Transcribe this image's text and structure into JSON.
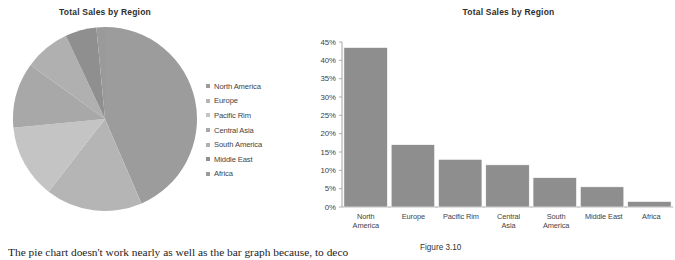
{
  "pie": {
    "title": "Total Sales by Region",
    "legend": [
      {
        "label": "North America",
        "color": "#9c9c9c"
      },
      {
        "label": "Europe",
        "color": "#b5b5b5"
      },
      {
        "label": "Pacific Rim",
        "color": "#c4c4c4"
      },
      {
        "label": "Central Asia",
        "color": "#a8a8a8"
      },
      {
        "label": "South America",
        "color": "#b0b0b0"
      },
      {
        "label": "Middle East",
        "color": "#8f8f8f"
      },
      {
        "label": "Africa",
        "color": "#9a9a9a"
      }
    ]
  },
  "bar": {
    "title": "Total Sales by Region"
  },
  "caption": {
    "figure_label": "Figure 3.10"
  },
  "body": {
    "paragraph": "The pie chart doesn't work nearly as well as the bar graph because, to decode it"
  },
  "chart_data": [
    {
      "type": "pie",
      "title": "Total Sales by Region",
      "categories": [
        "North America",
        "Europe",
        "Pacific Rim",
        "Central Asia",
        "South America",
        "Middle East",
        "Africa"
      ],
      "values": [
        43.5,
        17,
        13,
        11.5,
        8,
        5.5,
        1.5
      ],
      "unit": "%",
      "legend_position": "right",
      "start_angle_deg": 0,
      "direction": "clockwise",
      "slice_colors": [
        "#9c9c9c",
        "#b5b5b5",
        "#c4c4c4",
        "#a8a8a8",
        "#b0b0b0",
        "#8f8f8f",
        "#9a9a9a"
      ]
    },
    {
      "type": "bar",
      "title": "Total Sales by Region",
      "categories": [
        "North America",
        "Europe",
        "Pacific Rim",
        "Central Asia",
        "South America",
        "Middle East",
        "Africa"
      ],
      "category_lines": [
        [
          "North",
          "America"
        ],
        [
          "Europe"
        ],
        [
          "Pacific Rim"
        ],
        [
          "Central",
          "Asia"
        ],
        [
          "South",
          "America"
        ],
        [
          "Middle East"
        ],
        [
          "Africa"
        ]
      ],
      "values": [
        43.5,
        17,
        13,
        11.5,
        8,
        5.5,
        1.5
      ],
      "xlabel": "",
      "ylabel": "",
      "ylim": [
        0,
        45
      ],
      "ytick_values": [
        0,
        5,
        10,
        15,
        20,
        25,
        30,
        35,
        40,
        45
      ],
      "ytick_labels": [
        "0%",
        "5%",
        "10%",
        "15%",
        "20%",
        "25%",
        "30%",
        "35%",
        "40%",
        "45%"
      ],
      "grid": false,
      "legend": false,
      "bar_color": "#8e8e8e"
    }
  ]
}
